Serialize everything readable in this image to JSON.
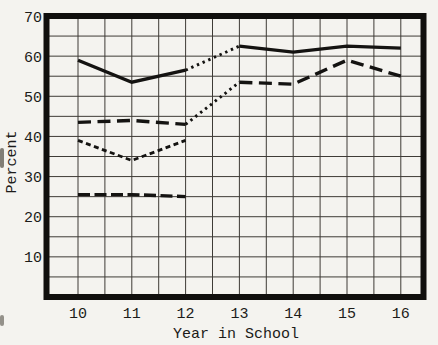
{
  "chart_data": {
    "type": "line",
    "title": "",
    "xlabel": "Year in School",
    "ylabel": "Percent",
    "xlim": [
      9.5,
      16.5
    ],
    "ylim": [
      0,
      70
    ],
    "x_ticks": [
      10,
      11,
      12,
      13,
      14,
      15,
      16
    ],
    "y_ticks": [
      70,
      60,
      50,
      40,
      30,
      20,
      10
    ],
    "x_minor_step": 0.5,
    "y_minor_step": 5,
    "grid": "on",
    "legend": "none",
    "series": [
      {
        "name": "solid-line",
        "style": "solid",
        "x": [
          10,
          11,
          12,
          13,
          14,
          15,
          16
        ],
        "values": [
          59,
          53.5,
          56.5,
          62.5,
          61,
          62.5,
          62
        ],
        "dotted_segment": [
          12,
          13
        ]
      },
      {
        "name": "long-dash-line",
        "style": "long-dash",
        "x": [
          10,
          11,
          12,
          13,
          14,
          15,
          16
        ],
        "values": [
          43.5,
          44,
          43,
          53.5,
          53,
          59,
          55
        ],
        "dotted_segment": [
          12,
          13
        ]
      },
      {
        "name": "short-dash-line",
        "style": "short-dash",
        "x": [
          10,
          11,
          12
        ],
        "values": [
          39,
          34,
          39
        ]
      },
      {
        "name": "flat-dash-line",
        "style": "medium-dash",
        "x": [
          10,
          11,
          12
        ],
        "values": [
          25.5,
          25.5,
          25
        ]
      }
    ],
    "colors": {
      "line": "#141311",
      "grid": "#3e3b36",
      "frame": "#100f0d",
      "background": "#f4f3ef",
      "text": "#1c1b19"
    }
  }
}
